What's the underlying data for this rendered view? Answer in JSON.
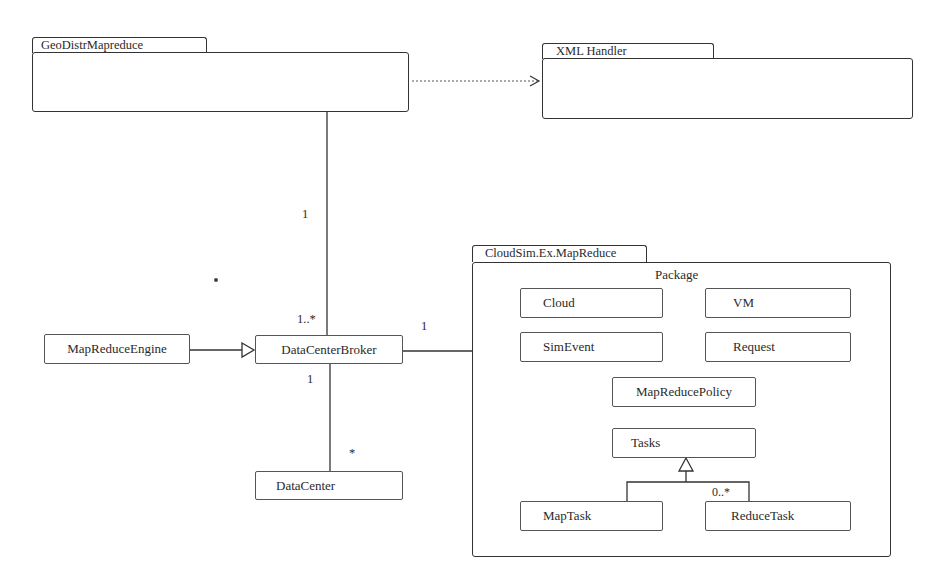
{
  "diagram": {
    "type": "UML package/class diagram",
    "packages": [
      {
        "id": "geo",
        "name": "GeoDistrMapreduce"
      },
      {
        "id": "xml",
        "name": "XML Handler"
      },
      {
        "id": "cloudsim",
        "name": "CloudSim.Ex.MapReduce",
        "stereotype_label": "Package"
      }
    ],
    "classes": {
      "map_reduce_engine": "MapReduceEngine",
      "data_center_broker": "DataCenterBroker",
      "data_center": "DataCenter",
      "cloud": "Cloud",
      "vm": "VM",
      "sim_event": "SimEvent",
      "request": "Request",
      "map_reduce_policy": "MapReducePolicy",
      "tasks": "Tasks",
      "map_task": "MapTask",
      "reduce_task": "ReduceTask"
    },
    "multiplicities": {
      "geo_end": "1",
      "broker_from_geo": "1..*",
      "broker_to_package": "1",
      "broker_to_datacenter": "1",
      "datacenter_end": "*",
      "reduce_task": "0..*"
    },
    "relations": [
      {
        "from": "GeoDistrMapreduce",
        "to": "XML Handler",
        "kind": "dependency (dotted arrow)"
      },
      {
        "from": "GeoDistrMapreduce",
        "to": "DataCenterBroker",
        "kind": "association",
        "mult_from": "1",
        "mult_to": "1..*"
      },
      {
        "from": "MapReduceEngine",
        "to": "DataCenterBroker",
        "kind": "generalization"
      },
      {
        "from": "DataCenterBroker",
        "to": "CloudSim.Ex.MapReduce",
        "kind": "association",
        "mult": "1"
      },
      {
        "from": "DataCenterBroker",
        "to": "DataCenter",
        "kind": "association",
        "mult_from": "1",
        "mult_to": "*"
      },
      {
        "from": "MapTask",
        "to": "Tasks",
        "kind": "generalization"
      },
      {
        "from": "ReduceTask",
        "to": "Tasks",
        "kind": "generalization",
        "mult": "0..*"
      }
    ],
    "colors": {
      "line": "#333333",
      "background": "#ffffff"
    }
  }
}
